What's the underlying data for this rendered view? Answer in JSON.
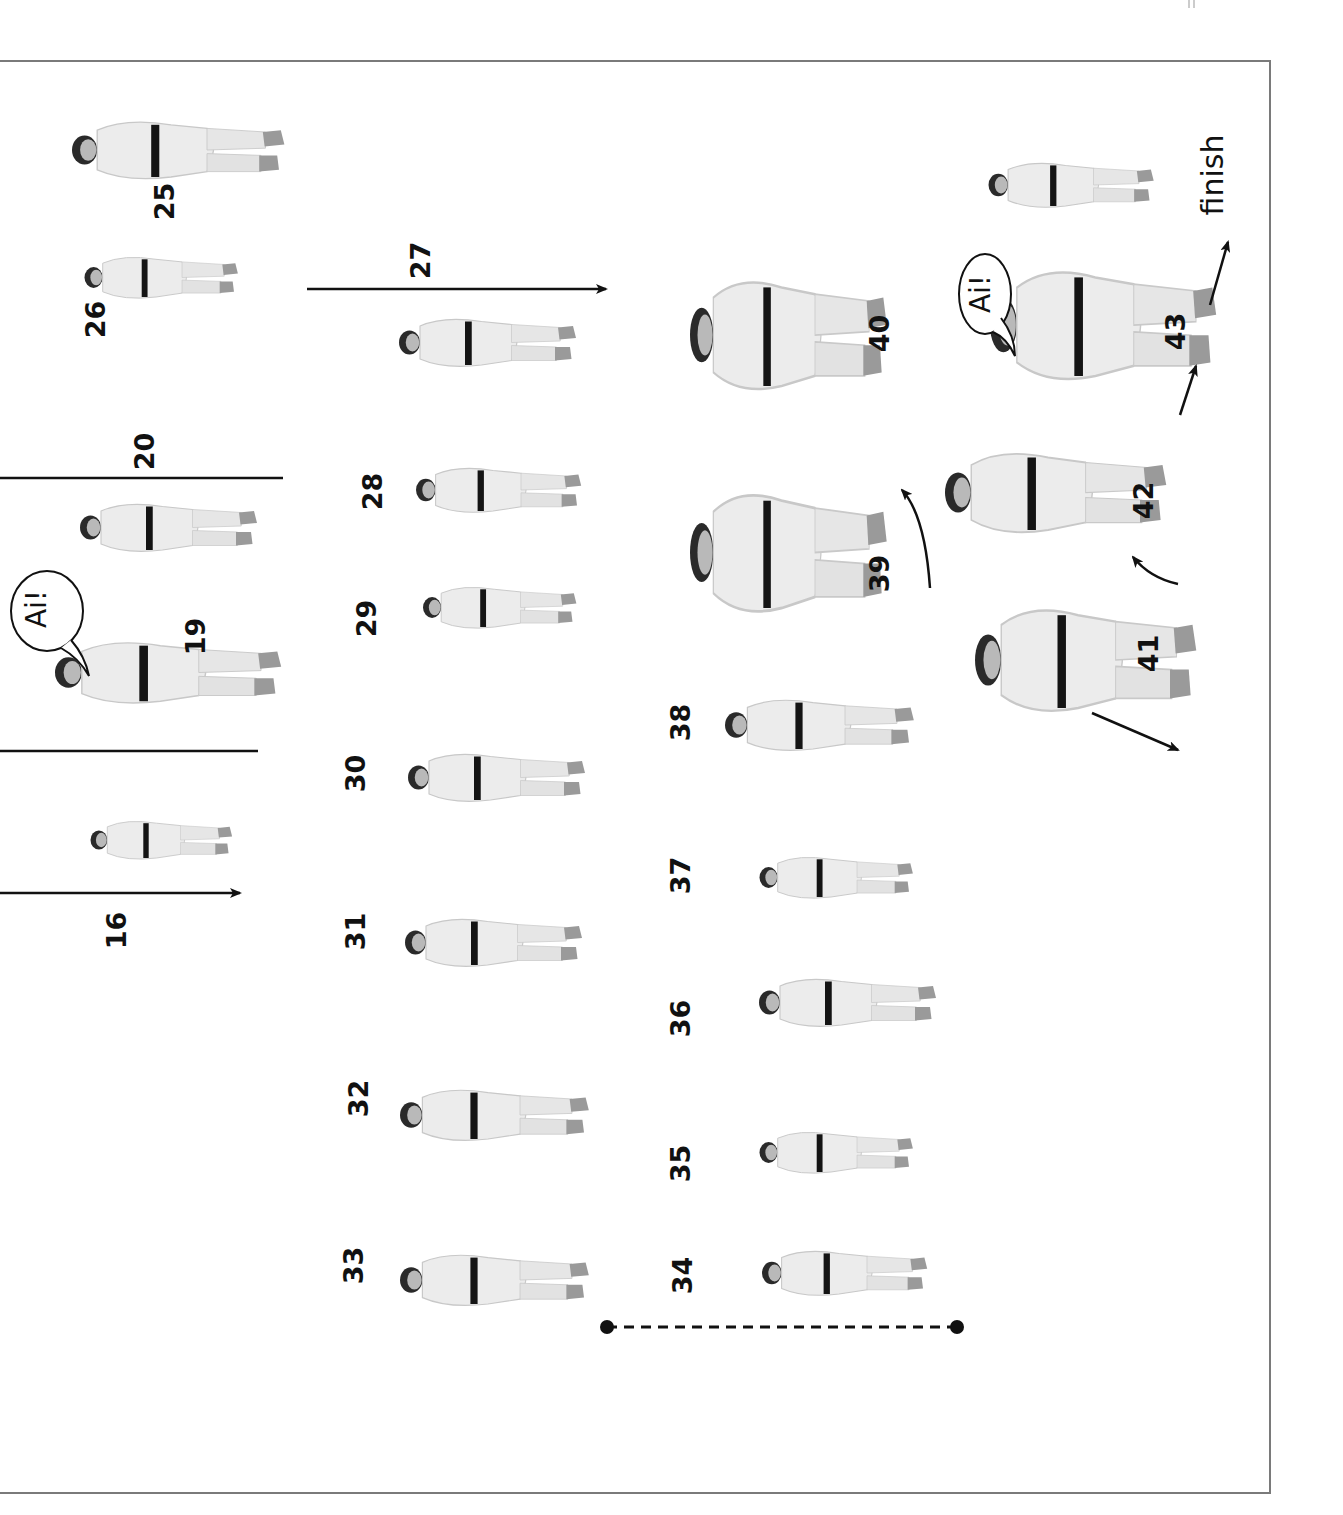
{
  "page": {
    "orientation": "rotated 90 degrees counter-clockwise",
    "border_color": "#7a7a7a",
    "ink_color": "#111111"
  },
  "steps": {
    "s16": "16",
    "s19": "19",
    "s20": "20",
    "s25": "25",
    "s26": "26",
    "s27": "27",
    "s28": "28",
    "s29": "29",
    "s30": "30",
    "s31": "31",
    "s32": "32",
    "s33": "33",
    "s34": "34",
    "s35": "35",
    "s36": "36",
    "s37": "37",
    "s38": "38",
    "s39": "39",
    "s40": "40",
    "s41": "41",
    "s42": "42",
    "s43": "43"
  },
  "labels": {
    "finish": "finish"
  },
  "kiai": {
    "bubble_19": "Ai!",
    "bubble_43": "Ai!"
  },
  "annotations": {
    "arrows": [
      "straight arrow (16)",
      "divider lines around 19",
      "long arrow (27)",
      "curved arrow (39→40)",
      "curved arrow (41→42)",
      "arrow (43)",
      "arrow (finish)",
      "arrow (41 lower)"
    ],
    "dotted_line": "dashed connector with end dots beneath 34"
  }
}
